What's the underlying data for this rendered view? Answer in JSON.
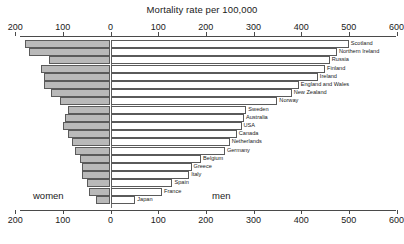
{
  "chart_data": {
    "type": "bar",
    "title": "Mortality rate per 100,000",
    "subtitle": "",
    "xlabel": "",
    "ylabel": "",
    "orientation": "horizontal-diverging",
    "grid": false,
    "legend_position": "inline",
    "axis": {
      "left_label": "women",
      "right_label": "men",
      "ticks_left": [
        200,
        100
      ],
      "tick_zero": 0,
      "ticks_right": [
        100,
        200,
        300,
        400,
        500,
        600
      ],
      "tick_labels": [
        "200",
        "100",
        "0",
        "100",
        "200",
        "300",
        "400",
        "500",
        "600"
      ],
      "women_max": 200,
      "men_max": 600,
      "duplicated_top_and_bottom": true
    },
    "categories": [
      "Scotland",
      "Northern Ireland",
      "Russia",
      "Finland",
      "Ireland",
      "England and Wales",
      "New Zealand",
      "Norway",
      "Sweden",
      "Australia",
      "USA",
      "Canada",
      "Netherlands",
      "Germany",
      "Belgium",
      "Greece",
      "Italy",
      "Spain",
      "France",
      "Japan"
    ],
    "series": [
      {
        "name": "women",
        "values": [
          180,
          170,
          130,
          145,
          140,
          140,
          125,
          105,
          90,
          95,
          100,
          90,
          80,
          75,
          65,
          60,
          60,
          50,
          45,
          30
        ]
      },
      {
        "name": "men",
        "values": [
          500,
          475,
          460,
          450,
          435,
          395,
          380,
          350,
          285,
          280,
          275,
          265,
          250,
          240,
          190,
          170,
          165,
          130,
          108,
          52
        ]
      }
    ]
  }
}
